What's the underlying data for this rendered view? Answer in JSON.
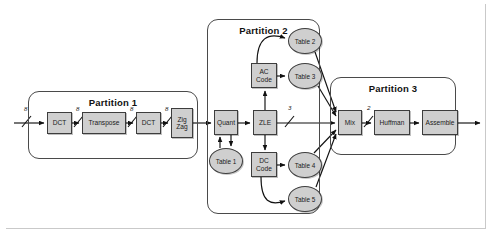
{
  "diagram": {
    "background_color": "#ffffff",
    "node_fill_color": "#cfcfcf",
    "node_stroke_color": "#3d3d3d",
    "partition_stroke_color": "#4a4a4a",
    "arrow_color": "#111111"
  },
  "partitions": [
    {
      "id": "partition-1",
      "label": "Partition 1",
      "x": 28,
      "y": 91,
      "w": 170,
      "h": 68
    },
    {
      "id": "partition-2",
      "label": "Partition 2",
      "x": 207,
      "y": 19,
      "w": 113,
      "h": 195
    },
    {
      "id": "partition-3",
      "label": "Partition 3",
      "x": 330,
      "y": 77,
      "w": 126,
      "h": 78
    }
  ],
  "nodes": [
    {
      "id": "dct-1",
      "label": "DCT",
      "shape": "box",
      "x": 47,
      "y": 112,
      "w": 25,
      "h": 22
    },
    {
      "id": "transpose",
      "label": "Transpose",
      "shape": "box",
      "x": 82,
      "y": 112,
      "w": 44,
      "h": 22
    },
    {
      "id": "dct-2",
      "label": "DCT",
      "shape": "box",
      "x": 136,
      "y": 112,
      "w": 25,
      "h": 22
    },
    {
      "id": "zigzag",
      "label": "Zig\nZag",
      "shape": "box",
      "x": 171,
      "y": 108,
      "w": 22,
      "h": 30
    },
    {
      "id": "quant",
      "label": "Quant",
      "shape": "box",
      "x": 214,
      "y": 110,
      "w": 24,
      "h": 25
    },
    {
      "id": "table-1",
      "label": "Table 1",
      "shape": "ellipse",
      "x": 209,
      "y": 148,
      "w": 34,
      "h": 26
    },
    {
      "id": "zle",
      "label": "ZLE",
      "shape": "box",
      "x": 253,
      "y": 110,
      "w": 24,
      "h": 25
    },
    {
      "id": "ac-code",
      "label": "AC\nCode",
      "shape": "box",
      "x": 251,
      "y": 63,
      "w": 26,
      "h": 25
    },
    {
      "id": "dc-code",
      "label": "DC\nCode",
      "shape": "box",
      "x": 251,
      "y": 152,
      "w": 26,
      "h": 25
    },
    {
      "id": "table-2",
      "label": "Table 2",
      "shape": "ellipse",
      "x": 288,
      "y": 28,
      "w": 34,
      "h": 26
    },
    {
      "id": "table-3",
      "label": "Table 3",
      "shape": "ellipse",
      "x": 288,
      "y": 63,
      "w": 34,
      "h": 26
    },
    {
      "id": "table-4",
      "label": "Table 4",
      "shape": "ellipse",
      "x": 288,
      "y": 152,
      "w": 34,
      "h": 26
    },
    {
      "id": "table-5",
      "label": "Table 5",
      "shape": "ellipse",
      "x": 288,
      "y": 186,
      "w": 34,
      "h": 26
    },
    {
      "id": "mix",
      "label": "Mix",
      "shape": "box",
      "x": 338,
      "y": 110,
      "w": 24,
      "h": 25
    },
    {
      "id": "huffman",
      "label": "Huffman",
      "shape": "box",
      "x": 374,
      "y": 110,
      "w": 36,
      "h": 25
    },
    {
      "id": "assemble",
      "label": "Assemble",
      "shape": "box",
      "x": 422,
      "y": 110,
      "w": 36,
      "h": 25
    }
  ],
  "bus_labels": [
    {
      "id": "bus-input",
      "text": "8",
      "x": 24,
      "y": 105
    },
    {
      "id": "bus-dct1-out",
      "text": "8",
      "x": 75,
      "y": 105
    },
    {
      "id": "bus-trans-out",
      "text": "8",
      "x": 129,
      "y": 105
    },
    {
      "id": "bus-dct2-out",
      "text": "8",
      "x": 164,
      "y": 105
    },
    {
      "id": "bus-zle-out",
      "text": "3",
      "x": 287,
      "y": 105
    },
    {
      "id": "bus-mix-out",
      "text": "2",
      "x": 366,
      "y": 105
    }
  ],
  "edges": [
    {
      "id": "edge-input-dct1",
      "from": "input",
      "to": "dct-1"
    },
    {
      "id": "edge-dct1-transpose",
      "from": "dct-1",
      "to": "transpose"
    },
    {
      "id": "edge-transpose-dct2",
      "from": "transpose",
      "to": "dct-2"
    },
    {
      "id": "edge-dct2-zigzag",
      "from": "dct-2",
      "to": "zigzag"
    },
    {
      "id": "edge-zigzag-quant",
      "from": "zigzag",
      "to": "quant"
    },
    {
      "id": "edge-quant-table1",
      "from": "quant",
      "to": "table-1"
    },
    {
      "id": "edge-table1-quant",
      "from": "table-1",
      "to": "quant"
    },
    {
      "id": "edge-quant-zle",
      "from": "quant",
      "to": "zle"
    },
    {
      "id": "edge-zle-accode",
      "from": "zle",
      "to": "ac-code"
    },
    {
      "id": "edge-zle-dccode",
      "from": "zle",
      "to": "dc-code"
    },
    {
      "id": "edge-zle-mix",
      "from": "zle",
      "to": "mix"
    },
    {
      "id": "edge-accode-table2",
      "from": "ac-code",
      "to": "table-2"
    },
    {
      "id": "edge-accode-table3",
      "from": "ac-code",
      "to": "table-3"
    },
    {
      "id": "edge-dccode-table4",
      "from": "dc-code",
      "to": "table-4"
    },
    {
      "id": "edge-dccode-table5",
      "from": "dc-code",
      "to": "table-5"
    },
    {
      "id": "edge-table2-mix",
      "from": "table-2",
      "to": "mix"
    },
    {
      "id": "edge-table3-mix",
      "from": "table-3",
      "to": "mix"
    },
    {
      "id": "edge-table4-mix",
      "from": "table-4",
      "to": "mix"
    },
    {
      "id": "edge-table5-mix",
      "from": "table-5",
      "to": "mix"
    },
    {
      "id": "edge-mix-huffman",
      "from": "mix",
      "to": "huffman"
    },
    {
      "id": "edge-huffman-assemble",
      "from": "huffman",
      "to": "assemble"
    },
    {
      "id": "edge-assemble-output",
      "from": "assemble",
      "to": "output"
    }
  ]
}
